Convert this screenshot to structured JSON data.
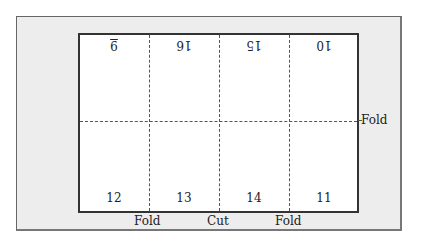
{
  "diagram": {
    "top_row_pages": [
      "9",
      "16",
      "15",
      "10"
    ],
    "bottom_row_pages": [
      "12",
      "13",
      "14",
      "11"
    ],
    "labels": {
      "fold_right": "Fold",
      "fold_left_bottom": "Fold",
      "cut_bottom": "Cut",
      "fold_right_bottom": "Fold"
    }
  }
}
